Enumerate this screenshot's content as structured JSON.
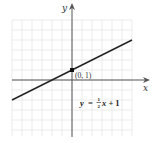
{
  "chart_data": {
    "type": "line",
    "title": "",
    "xlabel": "x",
    "ylabel": "y",
    "xlim": [
      -6,
      6
    ],
    "ylim": [
      -5.6,
      6
    ],
    "grid": true,
    "series": [
      {
        "name": "y = 1/2 x + 1",
        "equation": "y = (1/2)x + 1",
        "slope": 0.5,
        "intercept": 1,
        "x": [
          -6,
          6
        ],
        "y": [
          -2,
          4
        ],
        "color": "#222222"
      }
    ],
    "annotations": [
      {
        "type": "point",
        "x": 0,
        "y": 1,
        "label": "(0, 1)"
      },
      {
        "type": "text",
        "label": "y = ½x + 1"
      }
    ]
  },
  "labels": {
    "x_axis": "x",
    "y_axis": "y",
    "point": "(0, 1)",
    "eq_y": "y",
    "eq_eq": "=",
    "eq_num": "1",
    "eq_den": "2",
    "eq_rest": "x + 1"
  },
  "colors": {
    "grid": "#e6e6e6",
    "axis": "#555555",
    "line": "#222222",
    "point": "#111111"
  }
}
